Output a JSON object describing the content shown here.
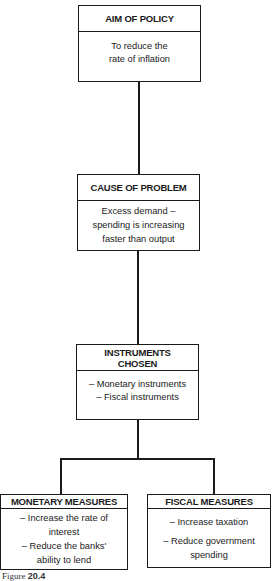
{
  "diagram": {
    "aim": {
      "title": "AIM OF POLICY",
      "lines": [
        "To reduce the",
        "rate of inflation"
      ]
    },
    "cause": {
      "title": "CAUSE OF PROBLEM",
      "lines": [
        "Excess demand –",
        "spending is increasing",
        "faster than output"
      ]
    },
    "instruments": {
      "title_lines": [
        "INSTRUMENTS",
        "CHOSEN"
      ],
      "lines": [
        "– Monetary instruments",
        "– Fiscal instruments"
      ]
    },
    "monetary": {
      "title": "MONETARY MEASURES",
      "lines": [
        "– Increase the rate of",
        "interest",
        "– Reduce the banks'",
        "ability to lend"
      ]
    },
    "fiscal": {
      "title": "FISCAL MEASURES",
      "lines": [
        "– Increase taxation",
        "– Reduce government",
        "spending"
      ]
    }
  },
  "caption": {
    "prefix": "Figure",
    "number": "20.4"
  }
}
